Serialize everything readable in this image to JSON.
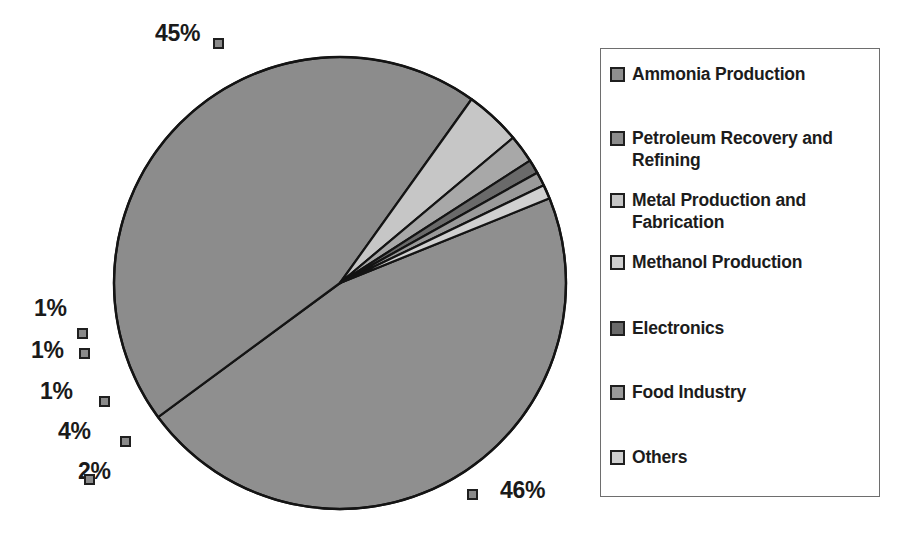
{
  "chart_data": {
    "type": "pie",
    "title": "",
    "subtitle": "",
    "xlabel": "",
    "ylabel": "",
    "legend_position": "right",
    "grid": false,
    "units": "percent",
    "categories": [
      "Ammonia Production",
      "Petroleum Recovery and Refining",
      "Metal Production and Fabrication",
      "Methanol Production",
      "Electronics",
      "Food Industry",
      "Others"
    ],
    "values": [
      46,
      45,
      4,
      2,
      1,
      1,
      1
    ],
    "data_labels": [
      "46%",
      "45%",
      "4%",
      "2%",
      "1%",
      "1%",
      "1%"
    ],
    "slice_colors": [
      "#8f8f8f",
      "#8c8c8c",
      "#c6c6c6",
      "#a8a8a8",
      "#6a6a6a",
      "#9a9a9a",
      "#d0d0d0"
    ],
    "slices": [
      {
        "label": "Ammonia Production",
        "value": 46,
        "data_label": "46%",
        "color": "#8f8f8f"
      },
      {
        "label": "Petroleum Recovery and Refining",
        "value": 45,
        "data_label": "45%",
        "color": "#8c8c8c"
      },
      {
        "label": "Metal Production and Fabrication",
        "value": 4,
        "data_label": "4%",
        "color": "#c6c6c6"
      },
      {
        "label": "Methanol Production",
        "value": 2,
        "data_label": "2%",
        "color": "#a8a8a8"
      },
      {
        "label": "Electronics",
        "value": 1,
        "data_label": "1%",
        "color": "#6a6a6a"
      },
      {
        "label": "Food Industry",
        "value": 1,
        "data_label": "1%",
        "color": "#9a9a9a"
      },
      {
        "label": "Others",
        "value": 1,
        "data_label": "1%",
        "color": "#d0d0d0"
      }
    ]
  },
  "pie": {
    "outline_color": "#141414",
    "center_x": 340,
    "center_y": 283,
    "radius": 226,
    "callouts": [
      {
        "name": "callout-45",
        "text": "45%",
        "label_x": 155,
        "label_y": 20,
        "marker_x": 213,
        "marker_y": 38
      },
      {
        "name": "callout-1-a",
        "text": "1%",
        "label_x": 34,
        "label_y": 295,
        "marker_x": 77,
        "marker_y": 328
      },
      {
        "name": "callout-1-b",
        "text": "1%",
        "label_x": 31,
        "label_y": 337,
        "marker_x": 79,
        "marker_y": 348
      },
      {
        "name": "callout-1-c",
        "text": "1%",
        "label_x": 40,
        "label_y": 378,
        "marker_x": 99,
        "marker_y": 396
      },
      {
        "name": "callout-4",
        "text": "4%",
        "label_x": 58,
        "label_y": 418,
        "marker_x": 120,
        "marker_y": 436
      },
      {
        "name": "callout-2",
        "text": "2%",
        "label_x": 78,
        "label_y": 458,
        "marker_x": 84,
        "marker_y": 474
      },
      {
        "name": "callout-46",
        "text": "46%",
        "label_x": 500,
        "label_y": 477,
        "marker_x": 467,
        "marker_y": 489
      }
    ]
  },
  "legend": {
    "border_color": "#6e6e6e",
    "items": [
      {
        "label": "Ammonia Production",
        "color": "#8f8f8f",
        "top": 14
      },
      {
        "label": "Petroleum Recovery and Refining",
        "color": "#8c8c8c",
        "top": 78
      },
      {
        "label": "Metal Production and Fabrication",
        "color": "#c6c6c6",
        "top": 140
      },
      {
        "label": "Methanol Production",
        "color": "#d0d0d0",
        "top": 202
      },
      {
        "label": "Electronics",
        "color": "#6a6a6a",
        "top": 268
      },
      {
        "label": "Food Industry",
        "color": "#9a9a9a",
        "top": 332
      },
      {
        "label": "Others",
        "color": "#d0d0d0",
        "top": 397
      }
    ]
  }
}
